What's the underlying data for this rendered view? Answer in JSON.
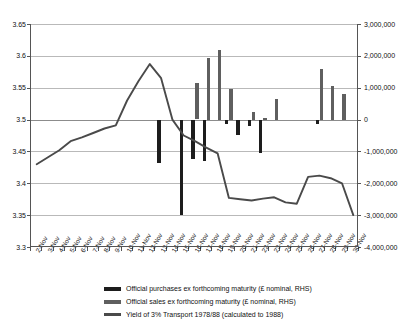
{
  "chart_data": {
    "type": "bar",
    "title": "",
    "xlabel": "",
    "ylabel": "",
    "grid": true,
    "legend_position": "bottom",
    "categories": [
      "2-Nov",
      "3-Nov",
      "4-Nov",
      "5-Nov",
      "6-Nov",
      "7-Nov",
      "8-Nov",
      "9-Nov",
      "10-Nov",
      "11-Nov",
      "12-Nov",
      "13-Nov",
      "14-Nov",
      "15-Nov",
      "16-Nov",
      "17-Nov",
      "18-Nov",
      "19-Nov",
      "20-Nov",
      "21-Nov",
      "22-Nov",
      "23-Nov",
      "24-Nov",
      "25-Nov",
      "26-Nov",
      "27-Nov",
      "28-Nov",
      "29-Nov",
      "30-Nov"
    ],
    "left_axis": {
      "label": "",
      "ylim": [
        3.3,
        3.65
      ],
      "ticks": [
        "3.3",
        "3.35",
        "3.4",
        "3.45",
        "3.5",
        "3.55",
        "3.6",
        "3.65"
      ],
      "tick_values": [
        3.3,
        3.35,
        3.4,
        3.45,
        3.5,
        3.55,
        3.6,
        3.65
      ]
    },
    "right_axis": {
      "label": "",
      "ylim": [
        -4000000,
        3000000
      ],
      "ticks": [
        "-4,000,000",
        "-3,000,000",
        "-2,000,000",
        "-1,000,000",
        "0",
        "1,000,000",
        "2,000,000",
        "3,000,000"
      ],
      "tick_values": [
        -4000000,
        -3000000,
        -2000000,
        -1000000,
        0,
        1000000,
        2000000,
        3000000
      ]
    },
    "series": [
      {
        "name": "Official purchases ex forthcoming maturity (£ nominal, RHS)",
        "type": "bar",
        "axis": "right",
        "color": "#1d1d1d",
        "values": [
          0,
          0,
          0,
          0,
          0,
          0,
          0,
          0,
          0,
          0,
          0,
          -1350000,
          0,
          -3000000,
          -1250000,
          -1300000,
          0,
          -150000,
          -500000,
          -200000,
          -1050000,
          0,
          0,
          0,
          0,
          -150000,
          0,
          0,
          0
        ]
      },
      {
        "name": "Official sales ex forthcoming maturity (£ nominal, RHS)",
        "type": "bar",
        "axis": "right",
        "color": "#5f5f5f",
        "values": [
          0,
          0,
          0,
          0,
          0,
          0,
          0,
          0,
          0,
          0,
          0,
          0,
          0,
          0,
          1150000,
          1950000,
          2200000,
          950000,
          0,
          250000,
          60000,
          650000,
          0,
          0,
          0,
          1600000,
          1050000,
          800000,
          0
        ]
      },
      {
        "name": "Yield of 3% Transport 1978/88 (calculated to 1988)",
        "type": "line",
        "axis": "left",
        "color": "#4a4a4a",
        "values": [
          3.43,
          3.441,
          3.452,
          3.466,
          3.472,
          3.479,
          3.486,
          3.491,
          3.53,
          3.56,
          3.587,
          3.565,
          3.5,
          3.475,
          3.466,
          3.456,
          3.447,
          3.377,
          3.375,
          3.373,
          3.376,
          3.378,
          3.37,
          3.368,
          3.41,
          3.412,
          3.408,
          3.4,
          3.35
        ]
      }
    ]
  },
  "legend": {
    "items": [
      {
        "label": "Official purchases ex forthcoming maturity (£ nominal, RHS)",
        "swatch": "purch"
      },
      {
        "label": "Official sales ex forthcoming maturity (£ nominal, RHS)",
        "swatch": "sales"
      },
      {
        "label": "Yield of 3% Transport 1978/88 (calculated to 1988)",
        "swatch": "yield"
      }
    ]
  }
}
